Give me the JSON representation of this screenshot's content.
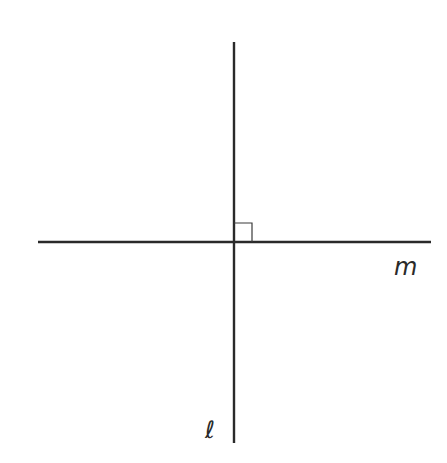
{
  "diagram": {
    "line_color": "#2a2a2a",
    "lines": [
      {
        "name": "m",
        "orientation": "horizontal",
        "label": "m"
      },
      {
        "name": "l",
        "orientation": "vertical",
        "label": "ℓ"
      }
    ],
    "right_angle_marker": true
  }
}
